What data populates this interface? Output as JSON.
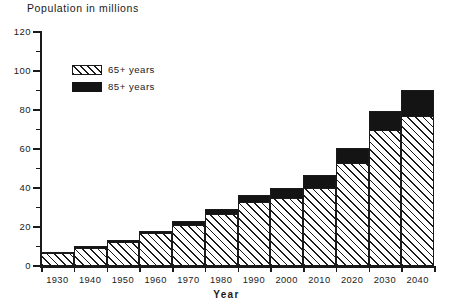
{
  "chart_data": {
    "type": "bar",
    "title": "Population in millions",
    "xlabel": "Year",
    "ylabel": "",
    "categories": [
      "1930",
      "1940",
      "1950",
      "1960",
      "1970",
      "1980",
      "1990",
      "2000",
      "2010",
      "2020",
      "2030",
      "2040"
    ],
    "series": [
      {
        "name": "65+ years",
        "pattern": "hatched",
        "values": [
          6.7,
          9.7,
          12.7,
          17.2,
          21.4,
          26.8,
          33.0,
          35.3,
          40.1,
          53.2,
          70.2,
          77.0
        ]
      },
      {
        "name": "85+ years",
        "pattern": "solid-black",
        "values": [
          0.3,
          0.4,
          0.6,
          0.9,
          1.5,
          2.3,
          3.3,
          4.9,
          6.6,
          7.4,
          9.2,
          13.5
        ]
      }
    ],
    "totals": [
      7.0,
      10.1,
      13.3,
      18.1,
      22.9,
      29.1,
      36.3,
      40.2,
      46.7,
      60.6,
      79.4,
      90.5
    ],
    "stacked": true,
    "ylim": [
      0,
      120
    ],
    "yticks": [
      0,
      20,
      40,
      60,
      80,
      100,
      120
    ],
    "yticks_minor": [
      10,
      30,
      50,
      70,
      90,
      110
    ],
    "grid": false,
    "legend_position": "upper-left-inside"
  },
  "legend": {
    "entries": [
      {
        "label": "65+ years",
        "swatch": "hatch-swatch"
      },
      {
        "label": "85+ years",
        "swatch": "solid-swatch"
      }
    ]
  },
  "axes": {
    "y_tick_labels": [
      "0",
      "20",
      "40",
      "60",
      "80",
      "100",
      "120"
    ],
    "x_tick_labels": [
      "1930",
      "1940",
      "1950",
      "1960",
      "1970",
      "1980",
      "1990",
      "2000",
      "2010",
      "2020",
      "2030",
      "2040"
    ],
    "x_axis_title": "Year"
  },
  "colors": {
    "ink": "#1a1a1a",
    "fill_85": "#141414",
    "background": "#ffffff"
  }
}
